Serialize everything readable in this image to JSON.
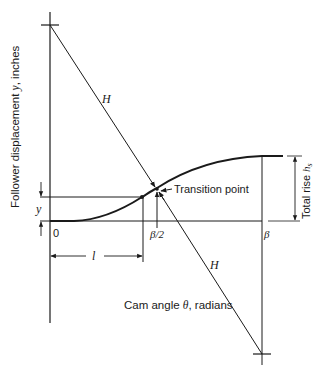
{
  "diagram": {
    "axes": {
      "y_label_prefix": "Follower displacement ",
      "y_label_var": "y",
      "y_label_suffix": ", inches",
      "x_label_prefix": "Cam angle ",
      "x_label_var": "θ",
      "x_label_suffix": ", radians"
    },
    "labels": {
      "origin": "0",
      "half_beta": "β/2",
      "beta": "β",
      "l": "l",
      "y": "y",
      "H_upper": "H",
      "H_lower": "H",
      "transition_point": "Transition point",
      "total_rise_prefix": "Total rise ",
      "total_rise_var": "h",
      "total_rise_sub": "s"
    },
    "colors": {
      "line": "#1a1a1a",
      "background": "#ffffff"
    }
  }
}
